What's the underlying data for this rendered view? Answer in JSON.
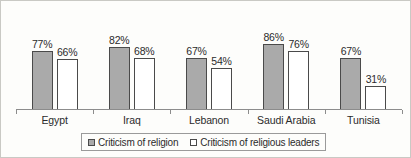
{
  "chart_data": {
    "type": "bar",
    "title": "",
    "subtitle": "",
    "xlabel": "",
    "ylabel": "",
    "ylim": [
      0,
      100
    ],
    "grid": false,
    "legend_position": "bottom",
    "categories": [
      "Egypt",
      "Iraq",
      "Lebanon",
      "Saudi Arabia",
      "Tunisia"
    ],
    "series": [
      {
        "name": "Criticism of religion",
        "swatch": "filled",
        "color": "#aaaaaa",
        "values": [
          77,
          82,
          67,
          86,
          67
        ],
        "labels": [
          "77%",
          "82%",
          "67%",
          "86%",
          "67%"
        ]
      },
      {
        "name": "Criticism of religious leaders",
        "swatch": "hollow",
        "color": "#ffffff",
        "values": [
          66,
          68,
          54,
          76,
          31
        ],
        "labels": [
          "66%",
          "68%",
          "54%",
          "76%",
          "31%"
        ]
      }
    ]
  },
  "legend": {
    "items": [
      {
        "label": "Criticism of religion",
        "marker": "filled-square-icon"
      },
      {
        "label": "Criticism of religious leaders",
        "marker": "hollow-square-icon"
      }
    ]
  },
  "axis": {
    "baseline": "category-axis"
  }
}
